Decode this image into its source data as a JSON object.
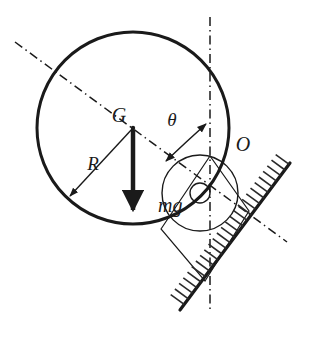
{
  "figure": {
    "background_color": "#ffffff",
    "stroke_color": "#1a1a1a",
    "width": 309,
    "height": 348
  },
  "labels": {
    "center_of_mass": "G",
    "contact_point": "O",
    "radius": "R",
    "weight_force": "mg",
    "angle": "θ"
  },
  "elements": {
    "big_circle": {
      "name": "body-outline-circle",
      "cx": 133,
      "cy": 128,
      "r": 96,
      "stroke_width": 3.0
    },
    "medium_circle": {
      "name": "inner-arc-circle",
      "cx": 200,
      "cy": 193,
      "r": 38,
      "stroke_width": 1.4
    },
    "small_circle": {
      "name": "pivot-circle",
      "cx": 200,
      "cy": 193,
      "r": 10,
      "stroke_width": 1.4
    },
    "weight_arrow": {
      "name": "mg-force-arrow",
      "x1": 133,
      "y1": 128,
      "x2": 133,
      "y2": 216,
      "stroke_width": 4.5
    },
    "radius_arrow": {
      "name": "radius-dimension-arrow",
      "x1": 133,
      "y1": 128,
      "x2": 68,
      "y2": 198,
      "stroke_width": 1.3
    },
    "incline": {
      "name": "inclined-surface",
      "x1": 180,
      "y1": 310,
      "x2": 290,
      "y2": 163,
      "stroke_width": 3.2,
      "hatch_count": 26,
      "hatch_length": 17
    },
    "axis_diagonal": {
      "name": "body-axis-dashdot-line",
      "x1": 15,
      "y1": 42,
      "x2": 287,
      "y2": 242
    },
    "axis_vertical": {
      "name": "vertical-reference-dashdot-line",
      "x": 210,
      "y1": 17,
      "y2": 313
    },
    "square_frame": {
      "name": "square-frame-outline",
      "points": "161,229 210,156 249,211 205,281",
      "stroke_width": 1.2
    },
    "theta_arc": {
      "name": "theta-angle-arc",
      "path": "M 169 159 Q 190 141 207 123",
      "stroke_width": 1.4
    }
  },
  "colors": {
    "ink": "#1a1a1a",
    "paper": "#ffffff",
    "hatch": "#2a2a2a"
  }
}
